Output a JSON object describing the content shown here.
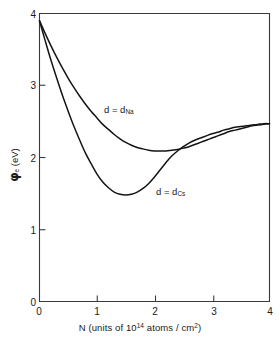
{
  "chart_data": {
    "type": "line",
    "title": "",
    "xlabel": "N (units of 10^14 atoms / cm^2)",
    "ylabel": "phi_e (eV)",
    "xlim": [
      0,
      4
    ],
    "ylim": [
      0,
      4
    ],
    "xticks": [
      "0",
      "1",
      "2",
      "3",
      "4"
    ],
    "yticks": [
      "0",
      "1",
      "2",
      "3",
      "4"
    ],
    "xtick_values": [
      0,
      1,
      2,
      3,
      4
    ],
    "ytick_values": [
      0,
      1,
      2,
      3,
      4
    ],
    "grid": false,
    "legend_position": "inline-annotation",
    "series": [
      {
        "name": "d = d_Na",
        "label": "d = d",
        "label_sub": "Na",
        "minimum": {
          "x": 2.05,
          "y": 2.09
        },
        "x": [
          0.0,
          0.1,
          0.2,
          0.3,
          0.4,
          0.5,
          0.6,
          0.7,
          0.8,
          0.9,
          1.0,
          1.1,
          1.2,
          1.3,
          1.4,
          1.5,
          1.6,
          1.7,
          1.8,
          1.9,
          2.0,
          2.1,
          2.2,
          2.3,
          2.4,
          2.5,
          2.6,
          2.7,
          2.8,
          2.9,
          3.0,
          3.1,
          3.2,
          3.3,
          3.4,
          3.5,
          3.6,
          3.7,
          3.8,
          3.9,
          4.0
        ],
        "y": [
          3.9,
          3.72,
          3.55,
          3.39,
          3.24,
          3.1,
          2.97,
          2.85,
          2.74,
          2.64,
          2.55,
          2.46,
          2.39,
          2.32,
          2.26,
          2.21,
          2.17,
          2.14,
          2.12,
          2.1,
          2.09,
          2.09,
          2.09,
          2.1,
          2.11,
          2.13,
          2.15,
          2.18,
          2.21,
          2.24,
          2.27,
          2.3,
          2.33,
          2.36,
          2.38,
          2.4,
          2.42,
          2.44,
          2.45,
          2.46,
          2.47
        ]
      },
      {
        "name": "d = d_Cs",
        "label": "d = d",
        "label_sub": "Cs",
        "minimum": {
          "x": 1.45,
          "y": 1.48
        },
        "x": [
          0.0,
          0.1,
          0.2,
          0.3,
          0.4,
          0.5,
          0.6,
          0.7,
          0.8,
          0.9,
          1.0,
          1.1,
          1.2,
          1.3,
          1.4,
          1.5,
          1.6,
          1.7,
          1.8,
          1.9,
          2.0,
          2.1,
          2.2,
          2.3,
          2.4,
          2.5,
          2.6,
          2.7,
          2.8,
          2.9,
          3.0,
          3.1,
          3.2,
          3.3,
          3.4,
          3.5,
          3.6,
          3.7,
          3.8,
          3.9,
          4.0
        ],
        "y": [
          3.9,
          3.62,
          3.35,
          3.1,
          2.86,
          2.64,
          2.43,
          2.24,
          2.06,
          1.91,
          1.77,
          1.66,
          1.58,
          1.52,
          1.49,
          1.48,
          1.49,
          1.52,
          1.57,
          1.64,
          1.73,
          1.83,
          1.93,
          2.02,
          2.09,
          2.15,
          2.2,
          2.24,
          2.27,
          2.3,
          2.33,
          2.35,
          2.38,
          2.4,
          2.42,
          2.43,
          2.44,
          2.45,
          2.46,
          2.47,
          2.47
        ]
      }
    ],
    "annotations": [
      {
        "text": "d = d",
        "sub": "Na",
        "x": 1.15,
        "y": 2.85
      },
      {
        "text": "d = d",
        "sub": "Cs",
        "x": 2.05,
        "y": 1.7
      }
    ]
  },
  "axes": {
    "x_title_prefix": "N (units of 10",
    "x_title_sup1": "14",
    "x_title_mid": " atoms / cm",
    "x_title_sup2": "2",
    "x_title_suffix": ")",
    "y_title_symbol": "φ",
    "y_title_sub": "e",
    "y_title_unit": "(eV)"
  },
  "style": {
    "curve_color": "#141414",
    "axis_color": "#3a3a3a",
    "background": "#ffffff"
  }
}
